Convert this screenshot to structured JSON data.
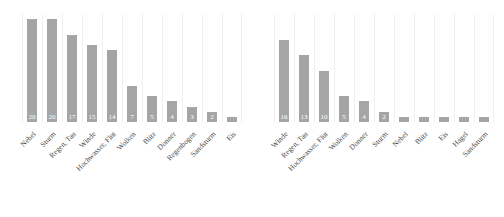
{
  "chart_data": [
    {
      "type": "bar",
      "title": "",
      "subtitle": "",
      "xlabel": "",
      "ylabel": "",
      "ylim": [
        0,
        21
      ],
      "grid": "vertical",
      "legend": "none",
      "orientation": "vertical",
      "bar_color": "#a5a5a5",
      "value_label_color": "#ffffff",
      "panel": "left",
      "categories": [
        "Nebel",
        "Sturm",
        "Regen, Tau",
        "Winde",
        "Hochwasser, Flut",
        "Wolken",
        "Blitz",
        "Donner",
        "Regenbogen",
        "Sandsturm",
        "Eis"
      ],
      "values": [
        20,
        20,
        17,
        15,
        14,
        7,
        5,
        4,
        3,
        2,
        1
      ],
      "value_labels": [
        "20",
        "20",
        "17",
        "15",
        "14",
        "7",
        "5",
        "4",
        "3",
        "2",
        ""
      ]
    },
    {
      "type": "bar",
      "title": "",
      "subtitle": "",
      "xlabel": "",
      "ylabel": "",
      "ylim": [
        0,
        21
      ],
      "grid": "vertical",
      "legend": "none",
      "orientation": "vertical",
      "bar_color": "#a5a5a5",
      "value_label_color": "#ffffff",
      "panel": "right",
      "categories": [
        "Winde",
        "Regen, Tau",
        "Hochwasser, Flut",
        "Wolken",
        "Donner",
        "Sturm",
        "Nebel",
        "Blitz",
        "Eis",
        "Hagel",
        "Sandsturm"
      ],
      "values": [
        16,
        13,
        10,
        5,
        4,
        2,
        1,
        1,
        1,
        1,
        1
      ],
      "value_labels": [
        "16",
        "13",
        "10",
        "5",
        "4",
        "2",
        "",
        "",
        "",
        "",
        ""
      ]
    }
  ],
  "colors": {
    "bar": "#a5a5a5",
    "gridline": "#f0f0f0",
    "label_text": "#4a4a4a",
    "value_text": "#ffffff",
    "background": "#ffffff"
  }
}
